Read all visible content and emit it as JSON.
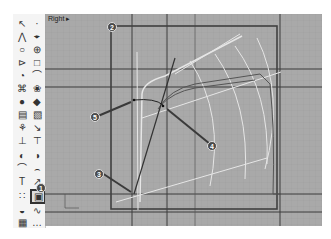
{
  "viewport": {
    "label": "Right",
    "label_arrow": "▸"
  },
  "toolbar": {
    "tools": [
      {
        "name": "select-arrow-icon",
        "glyph": "↖"
      },
      {
        "name": "point-icon",
        "glyph": "·"
      },
      {
        "name": "polyline-icon",
        "glyph": "⋀"
      },
      {
        "name": "control-point-curve-icon",
        "glyph": "⌖"
      },
      {
        "name": "circle-icon",
        "glyph": "○"
      },
      {
        "name": "ellipse-icon",
        "glyph": "⊕"
      },
      {
        "name": "arc-icon",
        "glyph": "⊳"
      },
      {
        "name": "rectangle-icon",
        "glyph": "□"
      },
      {
        "name": "polygon-icon",
        "glyph": "◔"
      },
      {
        "name": "curve-tools-icon",
        "glyph": "⌒"
      },
      {
        "name": "surface-icon",
        "glyph": "⌘"
      },
      {
        "name": "surface-tools-icon",
        "glyph": "❀"
      },
      {
        "name": "solid-icon",
        "glyph": "●"
      },
      {
        "name": "solid-tools-icon",
        "glyph": "◆"
      },
      {
        "name": "mesh-icon",
        "glyph": "▤"
      },
      {
        "name": "mesh-tools-icon",
        "glyph": "▧"
      },
      {
        "name": "render-icon",
        "glyph": "⚘"
      },
      {
        "name": "render-tools-icon",
        "glyph": "↘"
      },
      {
        "name": "dimension-icon",
        "glyph": "⊥"
      },
      {
        "name": "annotation-icon",
        "glyph": "⊤"
      },
      {
        "name": "boolean-icon",
        "glyph": "◐"
      },
      {
        "name": "boolean-tools-icon",
        "glyph": "◑"
      },
      {
        "name": "fillet-icon",
        "glyph": "⌒"
      },
      {
        "name": "fillet-tools-icon",
        "glyph": "⌢"
      },
      {
        "name": "text-icon",
        "glyph": "T"
      },
      {
        "name": "transform-icon",
        "glyph": "↗"
      },
      {
        "name": "array-icon",
        "glyph": "∷"
      },
      {
        "name": "analyze-icon",
        "glyph": "▣"
      },
      {
        "name": "sphere-icon",
        "glyph": "◒"
      },
      {
        "name": "dimension-tools-icon",
        "glyph": "∿"
      },
      {
        "name": "grid-icon",
        "glyph": "▦"
      },
      {
        "name": "more-icon",
        "glyph": "…"
      }
    ]
  },
  "callouts": [
    "1",
    "2",
    "3",
    "4",
    "5"
  ],
  "colors": {
    "viewport_bg": "#a9a9a9",
    "grid_dark": "#3c3c3c",
    "frame": "#404040",
    "curve_light": "#e6e6e6",
    "callout_bg": "#4a4a4a"
  }
}
